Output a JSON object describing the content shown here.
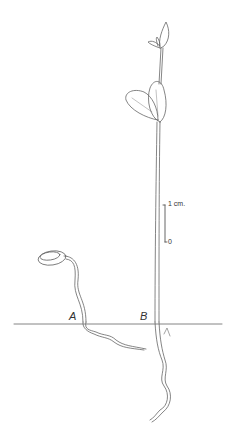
{
  "figure": {
    "labels": {
      "seedling_a": "A",
      "seedling_b": "B"
    },
    "scale_bar": {
      "top_label": "1 cm.",
      "bottom_label": "0"
    },
    "colors": {
      "ink": "#555555",
      "background": "#ffffff"
    }
  }
}
